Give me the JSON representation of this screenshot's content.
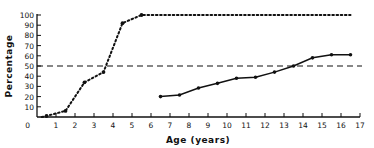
{
  "chart_data": {
    "type": "line",
    "title": "",
    "xlabel": "Age (years)",
    "ylabel": "Percentage",
    "xlim": [
      0,
      17
    ],
    "ylim": [
      0,
      100
    ],
    "x_ticks": [
      0,
      1,
      2,
      3,
      4,
      5,
      6,
      7,
      8,
      9,
      10,
      11,
      12,
      13,
      14,
      15,
      16,
      17
    ],
    "y_ticks": [
      10,
      20,
      30,
      40,
      50,
      60,
      70,
      80,
      90,
      100
    ],
    "y_tick_labels_shown": [
      0,
      10,
      20,
      30,
      40,
      50,
      60,
      70,
      80,
      90,
      100
    ],
    "grid": false,
    "legend": null,
    "series": [
      {
        "name": "dotted",
        "style": "dotted",
        "x": [
          0.25,
          0.5,
          1.5,
          2.5,
          3.5,
          4.5,
          5.5,
          16.5
        ],
        "y": [
          0,
          1,
          6,
          34,
          44,
          92,
          100,
          100
        ]
      },
      {
        "name": "solid",
        "style": "solid",
        "x": [
          6.5,
          7.5,
          8.5,
          9.5,
          10.5,
          11.5,
          12.5,
          13.5,
          14.5,
          15.5,
          16.5
        ],
        "y": [
          20,
          21.5,
          28.5,
          33,
          38,
          39,
          44,
          50,
          58,
          61,
          61
        ]
      }
    ],
    "reference_lines": [
      {
        "orientation": "horizontal",
        "y": 50,
        "style": "dashed"
      }
    ]
  },
  "labels": {
    "xlabel": "Age (years)",
    "ylabel": "Percentage"
  }
}
